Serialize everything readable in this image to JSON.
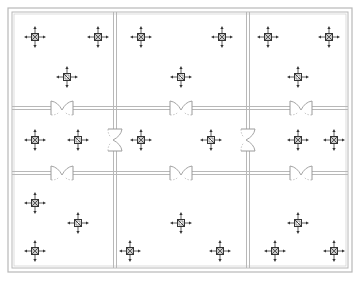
{
  "diagram": {
    "type": "floor-plan",
    "colors": {
      "wall": "#b8b8b8",
      "wall_inner": "#d4d4d4",
      "fixture": "#333333",
      "door": "#9a9a9a",
      "background": "#ffffff"
    },
    "outer_wall": {
      "x": 8,
      "y": 8,
      "w": 344,
      "h": 264,
      "gap": 4
    },
    "partitions": {
      "vertical": [
        115,
        248
      ],
      "horizontal": [
        108,
        173
      ]
    },
    "rooms": [
      {
        "id": "r1",
        "row": 0,
        "col": 0
      },
      {
        "id": "r2",
        "row": 0,
        "col": 1
      },
      {
        "id": "r3",
        "row": 0,
        "col": 2
      },
      {
        "id": "r4",
        "row": 1,
        "col": 0
      },
      {
        "id": "r5",
        "row": 1,
        "col": 1
      },
      {
        "id": "r6",
        "row": 1,
        "col": 2
      },
      {
        "id": "r7",
        "row": 2,
        "col": 0
      },
      {
        "id": "r8",
        "row": 2,
        "col": 1
      },
      {
        "id": "r9",
        "row": 2,
        "col": 2
      }
    ],
    "doors": [
      {
        "x": 62,
        "y": 108,
        "orient": "h"
      },
      {
        "x": 181,
        "y": 108,
        "orient": "h"
      },
      {
        "x": 301,
        "y": 108,
        "orient": "h"
      },
      {
        "x": 62,
        "y": 173,
        "orient": "h"
      },
      {
        "x": 181,
        "y": 173,
        "orient": "h"
      },
      {
        "x": 301,
        "y": 173,
        "orient": "h"
      },
      {
        "x": 115,
        "y": 140,
        "orient": "v"
      },
      {
        "x": 248,
        "y": 140,
        "orient": "v"
      }
    ],
    "fixtures": [
      {
        "x": 35,
        "y": 37,
        "kind": "x"
      },
      {
        "x": 98,
        "y": 37,
        "kind": "x"
      },
      {
        "x": 67,
        "y": 77,
        "kind": "slash"
      },
      {
        "x": 141,
        "y": 37,
        "kind": "x"
      },
      {
        "x": 222,
        "y": 37,
        "kind": "x"
      },
      {
        "x": 181,
        "y": 77,
        "kind": "slash"
      },
      {
        "x": 268,
        "y": 37,
        "kind": "x"
      },
      {
        "x": 329,
        "y": 37,
        "kind": "x"
      },
      {
        "x": 298,
        "y": 77,
        "kind": "slash"
      },
      {
        "x": 35,
        "y": 140,
        "kind": "x"
      },
      {
        "x": 78,
        "y": 140,
        "kind": "slash"
      },
      {
        "x": 141,
        "y": 140,
        "kind": "x"
      },
      {
        "x": 211,
        "y": 140,
        "kind": "slash"
      },
      {
        "x": 298,
        "y": 140,
        "kind": "x"
      },
      {
        "x": 334,
        "y": 140,
        "kind": "x"
      },
      {
        "x": 35,
        "y": 203,
        "kind": "x"
      },
      {
        "x": 78,
        "y": 223,
        "kind": "slash"
      },
      {
        "x": 130,
        "y": 251,
        "kind": "x"
      },
      {
        "x": 181,
        "y": 223,
        "kind": "slash"
      },
      {
        "x": 220,
        "y": 251,
        "kind": "x"
      },
      {
        "x": 298,
        "y": 223,
        "kind": "slash"
      },
      {
        "x": 275,
        "y": 251,
        "kind": "x"
      },
      {
        "x": 334,
        "y": 251,
        "kind": "x"
      },
      {
        "x": 35,
        "y": 251,
        "kind": "x"
      }
    ]
  }
}
